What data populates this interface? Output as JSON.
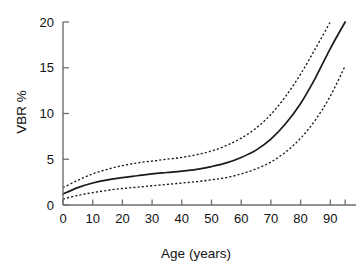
{
  "chart_data": {
    "type": "line",
    "title": "",
    "subtitle": "",
    "xlabel": "Age (years)",
    "ylabel": "VBR %",
    "xlim": [
      0,
      95
    ],
    "ylim": [
      0,
      20
    ],
    "grid": false,
    "legend": "none",
    "annotations": [],
    "x_ticks": [
      0,
      10,
      20,
      30,
      40,
      50,
      60,
      70,
      80,
      90
    ],
    "x_tick_labels": [
      "0",
      "10",
      "20",
      "30",
      "40",
      "50",
      "60",
      "70",
      "80",
      "90"
    ],
    "y_ticks": [
      0,
      5,
      10,
      15,
      20
    ],
    "y_tick_labels": [
      "0",
      "5",
      "10",
      "15",
      "20"
    ],
    "x": [
      0,
      5,
      10,
      15,
      20,
      25,
      30,
      35,
      40,
      45,
      50,
      55,
      60,
      65,
      70,
      75,
      80,
      85,
      90,
      95
    ],
    "series": [
      {
        "name": "Upper confidence limit",
        "style": "dashed",
        "color": "#1a1a1a",
        "values": [
          1.9,
          2.7,
          3.4,
          3.9,
          4.3,
          4.6,
          4.8,
          5.0,
          5.2,
          5.5,
          5.9,
          6.5,
          7.3,
          8.4,
          9.9,
          11.9,
          14.3,
          17.1,
          20.0,
          null
        ]
      },
      {
        "name": "Fitted mean VBR",
        "style": "solid",
        "color": "#1a1a1a",
        "values": [
          1.2,
          1.9,
          2.4,
          2.75,
          3.0,
          3.2,
          3.4,
          3.55,
          3.7,
          3.9,
          4.2,
          4.6,
          5.2,
          6.0,
          7.2,
          8.9,
          11.1,
          13.9,
          17.1,
          20.0
        ]
      },
      {
        "name": "Lower confidence limit",
        "style": "dashed",
        "color": "#1a1a1a",
        "values": [
          0.65,
          1.05,
          1.35,
          1.6,
          1.8,
          1.95,
          2.1,
          2.25,
          2.4,
          2.55,
          2.75,
          3.0,
          3.4,
          3.95,
          4.7,
          5.8,
          7.3,
          9.3,
          11.9,
          15.2
        ]
      }
    ]
  },
  "figure": {
    "background_color": "#ffffff",
    "axis_color": "#6e6e6e",
    "series_color": "#1a1a1a"
  }
}
